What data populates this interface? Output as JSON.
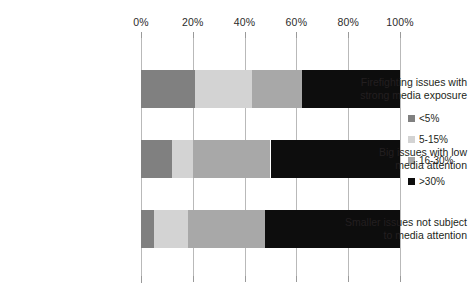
{
  "chart_data": {
    "type": "bar",
    "subtype": "stacked-horizontal-100",
    "title": "",
    "subtitle": "",
    "xlabel": "",
    "ylabel": "",
    "xlim": [
      0,
      100
    ],
    "xticks": [
      0,
      20,
      40,
      60,
      80,
      100
    ],
    "xtick_labels": [
      "0%",
      "20%",
      "40%",
      "60%",
      "80%",
      "100%"
    ],
    "grid": true,
    "grid_axis": "x",
    "legend_position": "right",
    "axis_position": "top",
    "categories": [
      "Firefighting issues with strong media exposure",
      "Big issues with low media attention",
      "Smaller issues not subject to media attention"
    ],
    "category_lines": [
      [
        "Firefighting issues with",
        "strong media exposure"
      ],
      [
        "Big issues with low",
        "media attention"
      ],
      [
        "Smaller issues not subject",
        "to media attention"
      ]
    ],
    "series": [
      {
        "name": "<5%",
        "color": "#808080",
        "values": [
          21,
          12,
          5
        ]
      },
      {
        "name": "5-15%",
        "color": "#d3d3d3",
        "values": [
          22,
          8,
          13
        ]
      },
      {
        "name": "16-30%",
        "color": "#a8a8a8",
        "values": [
          19,
          30,
          30
        ]
      },
      {
        "name": ">30%",
        "color": "#0d0d0d",
        "values": [
          38,
          50,
          52
        ]
      }
    ]
  },
  "colors": {
    "gridline": "#b9b9b9",
    "axis": "#9a9a9a",
    "text": "#231f20",
    "background": "#ffffff"
  }
}
